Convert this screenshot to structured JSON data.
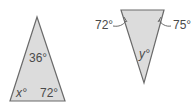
{
  "figures": [
    {
      "id": "triangle-1",
      "orientation": "apex-up",
      "vertices": [
        [
          37,
          17
        ],
        [
          10,
          101
        ],
        [
          65,
          101
        ]
      ],
      "fill": "#dcdcdc",
      "stroke": "#6a6a6a",
      "angles": [
        {
          "label": "36°",
          "position": "top"
        },
        {
          "label": "x°",
          "position": "bottom-left",
          "unknown": true
        },
        {
          "label": "72°",
          "position": "bottom-right"
        }
      ]
    },
    {
      "id": "triangle-2",
      "orientation": "apex-down",
      "vertices": [
        [
          121,
          10
        ],
        [
          164,
          10
        ],
        [
          144,
          83
        ]
      ],
      "fill": "#dcdcdc",
      "stroke": "#6a6a6a",
      "angles": [
        {
          "label": "72°",
          "position": "top-left",
          "external_label": true
        },
        {
          "label": "75°",
          "position": "top-right",
          "external_label": true
        },
        {
          "label": "y°",
          "position": "bottom",
          "unknown": true
        }
      ]
    }
  ],
  "labels": {
    "t1_top": "36°",
    "t1_left": "x°",
    "t1_right": "72°",
    "t2_left": "72°",
    "t2_right": "75°",
    "t2_bottom": "y°"
  }
}
